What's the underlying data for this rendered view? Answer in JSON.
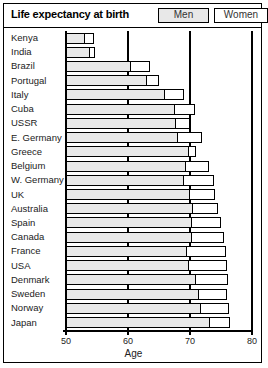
{
  "header": {
    "title": "Life expectancy at birth",
    "legend": [
      {
        "key": "men",
        "label": "Men",
        "color": "#e9e9e9"
      },
      {
        "key": "women",
        "label": "Women",
        "color": "#ffffff"
      }
    ]
  },
  "chart_data": {
    "type": "bar",
    "orientation": "horizontal",
    "stacked": true,
    "title": "Life expectancy at birth",
    "xlabel": "Age",
    "ylabel": "",
    "xlim": [
      50,
      80
    ],
    "xticks": [
      50,
      60,
      70,
      80
    ],
    "xticklabels": [
      "50",
      "60",
      "70",
      "80"
    ],
    "grid": true,
    "legend_position": "top-right",
    "categories": [
      "Kenya",
      "India",
      "Brazil",
      "Portugal",
      "Italy",
      "Cuba",
      "USSR",
      "E. Germany",
      "Greece",
      "Belgium",
      "W. Germany",
      "UK",
      "Australia",
      "Spain",
      "Canada",
      "France",
      "USA",
      "Denmark",
      "Sweden",
      "Norway",
      "Japan"
    ],
    "series": [
      {
        "name": "Men",
        "values": [
          53.0,
          53.9,
          60.5,
          63.0,
          66.0,
          67.5,
          67.8,
          68.1,
          69.8,
          69.4,
          69.0,
          70.0,
          70.5,
          70.4,
          70.4,
          69.5,
          69.8,
          71.0,
          71.5,
          71.8,
          73.2
        ]
      },
      {
        "name": "Women",
        "values": [
          54.5,
          54.7,
          63.5,
          65.0,
          69.0,
          70.8,
          70.0,
          72.0,
          71.0,
          73.0,
          73.8,
          74.0,
          74.5,
          75.0,
          75.5,
          75.8,
          76.0,
          76.2,
          76.0,
          76.3,
          76.5
        ]
      }
    ],
    "note": "Each row is a single bar: shaded segment ends at the male life expectancy, white segment extends to the female life expectancy."
  },
  "axis": {
    "label": "Age"
  }
}
